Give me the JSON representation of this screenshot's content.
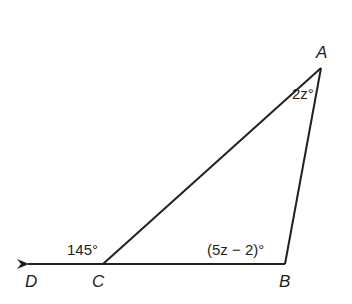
{
  "diagram": {
    "type": "triangle-exterior-angle",
    "stroke_color": "#231f20",
    "vertices": {
      "A": {
        "label": "A",
        "x": 321,
        "y": 68
      },
      "B": {
        "label": "B",
        "x": 285,
        "y": 264
      },
      "C": {
        "label": "C",
        "x": 103,
        "y": 264
      },
      "D": {
        "label": "D",
        "x": 25,
        "y": 264
      }
    },
    "angles": {
      "A": {
        "label": "2z°"
      },
      "B": {
        "label": "(5z − 2)°"
      },
      "exterior_C": {
        "label": "145°"
      }
    },
    "segments": [
      "AB",
      "BC",
      "CA",
      "ray CD"
    ]
  }
}
